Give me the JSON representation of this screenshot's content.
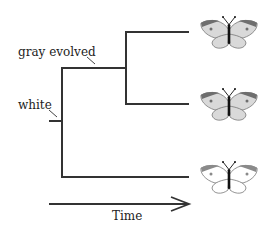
{
  "diagram": {
    "type": "phylogenetic-tree",
    "labels": {
      "gray_evolved": "gray evolved",
      "white": "white",
      "time_axis": "Time"
    },
    "leaves": [
      {
        "name": "butterfly-gray-1",
        "wing_color": "#d9d9d9",
        "tip_color": "#6e6e6e"
      },
      {
        "name": "butterfly-gray-2",
        "wing_color": "#d9d9d9",
        "tip_color": "#6e6e6e"
      },
      {
        "name": "butterfly-white",
        "wing_color": "#ffffff",
        "tip_color": "#8a8a8a"
      }
    ],
    "colors": {
      "line": "#333333",
      "outline": "#777777"
    }
  }
}
